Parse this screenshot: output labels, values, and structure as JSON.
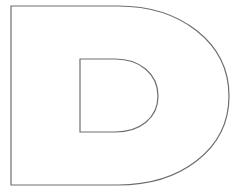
{
  "figure": {
    "letter": "D",
    "style": "outline",
    "stroke_color": "#6e6e6e",
    "fill_color": "#ffffff",
    "background_color": "#ffffff"
  }
}
